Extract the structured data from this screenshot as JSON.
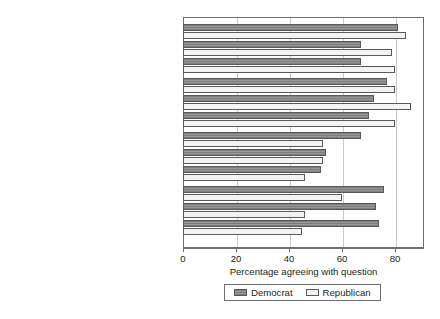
{
  "chart_data": {
    "type": "bar",
    "orientation": "horizontal",
    "title": "",
    "xlabel": "Percentage agreeing with question",
    "ylabel": "",
    "xlim": [
      0,
      91
    ],
    "xticks": [
      0,
      20,
      40,
      60,
      80
    ],
    "grid": true,
    "legend_position": "bottom",
    "groups": [
      {
        "label": "Trade war with China OK",
        "subcategories": [
          "Urban",
          "Suburban",
          "Rural"
        ],
        "Democrat": [
          81,
          67,
          67
        ],
        "Republican": [
          84,
          79,
          80
        ]
      },
      {
        "label": "Teach good history",
        "subcategories": [
          "Urban",
          "Suburban",
          "Rural"
        ],
        "Democrat": [
          77,
          72,
          70
        ],
        "Republican": [
          80,
          86,
          80
        ]
      },
      {
        "label": "Gas taxes fair",
        "subcategories": [
          "Urban",
          "Suburban",
          "Rural"
        ],
        "Democrat": [
          67,
          54,
          52
        ],
        "Republican": [
          53,
          53,
          46
        ]
      },
      {
        "label": "Use farmland for solar",
        "subcategories": [
          "Urban",
          "Suburban",
          "Rural"
        ],
        "Democrat": [
          76,
          73,
          74
        ],
        "Republican": [
          60,
          46,
          45
        ]
      }
    ],
    "series": [
      {
        "name": "Democrat",
        "color": "#7b7c7e",
        "values": [
          81,
          67,
          67,
          77,
          72,
          70,
          67,
          54,
          52,
          76,
          73,
          74
        ]
      },
      {
        "name": "Republican",
        "color": "#f4f3f1",
        "values": [
          84,
          79,
          80,
          80,
          86,
          80,
          53,
          53,
          46,
          60,
          46,
          45
        ]
      }
    ],
    "categories": [
      "Trade war with China OK - Urban",
      "Trade war with China OK - Suburban",
      "Trade war with China OK - Rural",
      "Teach good history - Urban",
      "Teach good history - Suburban",
      "Teach good history - Rural",
      "Gas taxes fair - Urban",
      "Gas taxes fair - Suburban",
      "Gas taxes fair - Rural",
      "Use farmland for solar - Urban",
      "Use farmland for solar - Suburban",
      "Use farmland for solar - Rural"
    ]
  },
  "legend": {
    "items": [
      {
        "label": "Democrat",
        "swatch": "dem"
      },
      {
        "label": "Republican",
        "swatch": "rep"
      }
    ]
  },
  "axis": {
    "x_title": "Percentage agreeing with question",
    "tick_labels": [
      "0",
      "20",
      "40",
      "60",
      "80"
    ]
  }
}
